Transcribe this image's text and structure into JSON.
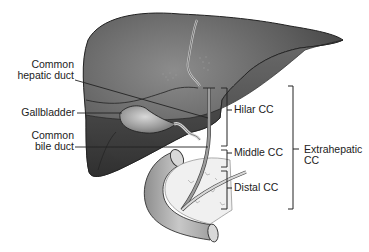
{
  "diagram": {
    "type": "anatomical-illustration",
    "structures": [
      "Liver",
      "Gallbladder",
      "Common hepatic duct",
      "Common bile duct",
      "Pancreas",
      "Duodenum"
    ],
    "labels": {
      "common_hepatic_duct_line1": "Common",
      "common_hepatic_duct_line2": "hepatic duct",
      "gallbladder": "Gallbladder",
      "common_bile_duct_line1": "Common",
      "common_bile_duct_line2": "bile duct",
      "hilar_cc": "Hilar CC",
      "middle_cc": "Middle CC",
      "distal_cc": "Distal CC",
      "extrahepatic_line1": "Extrahepatic",
      "extrahepatic_line2": "CC"
    },
    "colors": {
      "liver_dark": "#3c3c3c",
      "liver_light": "#8a8a8a",
      "duct": "#9a9a9a",
      "duodenum": "#b5b5b5",
      "pancreas": "#ececec",
      "line": "#222222"
    }
  }
}
